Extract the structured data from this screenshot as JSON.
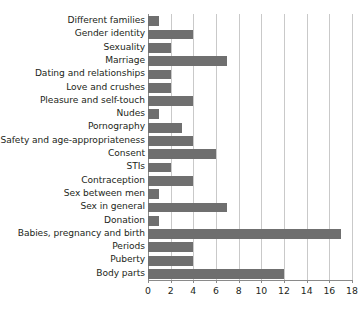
{
  "chart_data": {
    "type": "bar",
    "orientation": "horizontal",
    "title": "",
    "subtitle": "",
    "xlabel": "",
    "ylabel": "",
    "xlim": [
      0,
      18
    ],
    "ylim": null,
    "xticks": [
      0,
      2,
      4,
      6,
      8,
      10,
      12,
      14,
      16,
      18
    ],
    "xtick_labels": [
      "0",
      "2",
      "4",
      "6",
      "8",
      "10",
      "12",
      "14",
      "16",
      "18"
    ],
    "grid": "vertical",
    "legend": false,
    "legend_position": "none",
    "bar_color": "#6f6f6f",
    "grid_color": "#c9c9c9",
    "axis_color": "#8a8a8a",
    "text_color": "#231f20",
    "background": "#ffffff",
    "categories": [
      "Different families",
      "Gender identity",
      "Sexuality",
      "Marriage",
      "Dating and relationships",
      "Love and crushes",
      "Pleasure and self-touch",
      "Nudes",
      "Pornography",
      "Safety and age-appropriateness",
      "Consent",
      "STIs",
      "Contraception",
      "Sex between men",
      "Sex in general",
      "Donation",
      "Babies, pregnancy and birth",
      "Periods",
      "Puberty",
      "Body parts"
    ],
    "values": [
      1,
      4,
      2,
      7,
      2,
      2,
      4,
      1,
      3,
      4,
      6,
      2,
      4,
      1,
      7,
      1,
      17,
      4,
      4,
      12
    ]
  }
}
